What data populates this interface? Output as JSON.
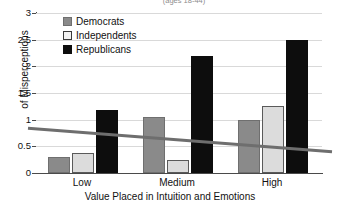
{
  "chart_data": {
    "type": "bar",
    "title": "(ages 18-44)",
    "title_truncated": true,
    "xlabel": "Value Placed in Intuition and Emotions",
    "ylabel": "of Misperceptions",
    "categories": [
      "Low",
      "Medium",
      "High"
    ],
    "series": [
      {
        "name": "Democrats",
        "color": "#8a8a8a",
        "values": [
          0.3,
          1.05,
          1.0
        ]
      },
      {
        "name": "Independents",
        "color": "#dcdcdc",
        "values": [
          0.37,
          0.25,
          1.25
        ]
      },
      {
        "name": "Republicans",
        "color": "#0d0d0d",
        "values": [
          1.18,
          2.2,
          2.5
        ]
      }
    ],
    "ylim": [
      0,
      3
    ],
    "yticks": [
      "0",
      "0.5",
      "1",
      "1.5",
      "2",
      "2.5",
      "3"
    ],
    "ytick_values": [
      0,
      0.5,
      1,
      1.5,
      2,
      2.5,
      3
    ],
    "grid": true,
    "legend_position": "top-left-inside",
    "trendline": {
      "name": "trend",
      "color": "#6e6e6e",
      "y_start": 0.84,
      "y_end": 0.4
    }
  }
}
